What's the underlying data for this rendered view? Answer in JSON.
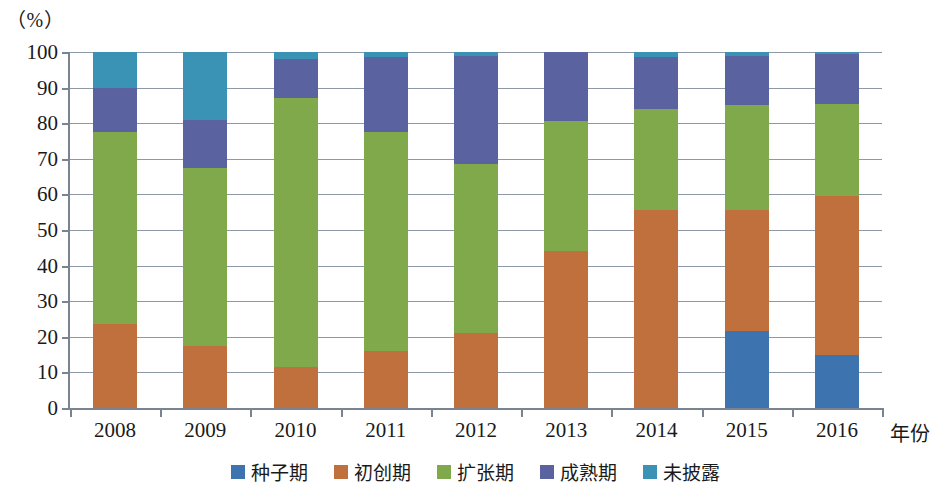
{
  "chart_data": {
    "type": "bar",
    "subtype": "stacked-percentage",
    "title": "",
    "xlabel": "年份",
    "ylabel": "（%）",
    "ylim": [
      0,
      100
    ],
    "ytick_labels": [
      "0",
      "10",
      "20",
      "30",
      "40",
      "50",
      "60",
      "70",
      "80",
      "90",
      "100"
    ],
    "ytick_values": [
      0,
      10,
      20,
      30,
      40,
      50,
      60,
      70,
      80,
      90,
      100
    ],
    "grid": true,
    "legend_position": "bottom-center",
    "categories": [
      "2008",
      "2009",
      "2010",
      "2011",
      "2012",
      "2013",
      "2014",
      "2015",
      "2016"
    ],
    "series": [
      {
        "name": "种子期",
        "color": "#3d74b0",
        "values": [
          0,
          0,
          0,
          0,
          0,
          0,
          0,
          21.5,
          15.0
        ]
      },
      {
        "name": "初创期",
        "color": "#c0703c",
        "values": [
          23.5,
          17.5,
          11.5,
          16.0,
          21.0,
          44.0,
          55.5,
          34.0,
          44.5
        ]
      },
      {
        "name": "扩张期",
        "color": "#7fa94a",
        "values": [
          54.0,
          50.0,
          75.5,
          61.5,
          47.5,
          36.5,
          28.5,
          29.5,
          26.0
        ]
      },
      {
        "name": "成熟期",
        "color": "#5b62a0",
        "values": [
          12.5,
          13.5,
          11.0,
          21.0,
          30.5,
          19.5,
          14.5,
          14.0,
          14.0
        ]
      },
      {
        "name": "未披露",
        "color": "#3a92b5",
        "values": [
          10.0,
          19.0,
          2.0,
          1.5,
          1.0,
          0,
          1.5,
          1.0,
          0.5
        ]
      }
    ],
    "cumulative_tops": {
      "2008": [
        23.5,
        77.5,
        90.0,
        100.0
      ],
      "2009": [
        17.5,
        67.5,
        81.0,
        100.0
      ],
      "2010": [
        11.5,
        87.0,
        98.0,
        100.0
      ],
      "2011": [
        16.0,
        77.5,
        98.5,
        100.0
      ],
      "2012": [
        21.0,
        68.5,
        99.0,
        100.0
      ],
      "2013": [
        44.0,
        80.5,
        100.0,
        100.0
      ],
      "2014": [
        55.5,
        84.0,
        98.5,
        100.0
      ],
      "2015": [
        21.5,
        55.5,
        85.0,
        99.0
      ],
      "2016": [
        15.0,
        59.5,
        85.5,
        99.5
      ]
    }
  },
  "axis": {
    "unit_label": "（%）",
    "x_axis_title": "年份"
  },
  "style": {
    "axis_color": "#7a8490",
    "grid_color": "#8d99a6",
    "background": "#ffffff",
    "text_color": "#1a1a1a"
  }
}
